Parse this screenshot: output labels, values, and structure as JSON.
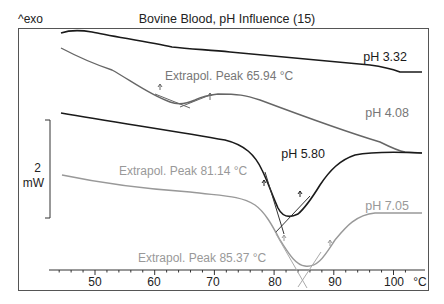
{
  "chart_data": {
    "type": "line",
    "title": "Bovine Blood, pH Influence (15)",
    "ylabel_exo": "^exo",
    "scale_bar": {
      "value": "2",
      "unit": "mW"
    },
    "xlabel": "°C",
    "xlim": [
      44,
      103
    ],
    "xticks": [
      50,
      60,
      70,
      80,
      90,
      100
    ],
    "x_tick_labels": [
      "50",
      "60",
      "70",
      "80",
      "90",
      "100"
    ],
    "grid": false,
    "legend_position": "inline labels at right of curves",
    "series": [
      {
        "name": "pH 3.32",
        "color": "#1a1a1a",
        "x": [
          45,
          47,
          50,
          55,
          60,
          65,
          70,
          75,
          80,
          85,
          90,
          95,
          98,
          100,
          102
        ],
        "y_rel_mW": [
          0.0,
          0.05,
          0.0,
          -0.2,
          -0.4,
          -0.65,
          -0.7,
          -0.8,
          -0.9,
          -1.0,
          -1.05,
          -1.15,
          -1.35,
          -1.35,
          -1.35
        ]
      },
      {
        "name": "pH 4.08",
        "color": "#666666",
        "annotation": "Extrapol. Peak 65.94 °C",
        "peak_temp_C": 65.94,
        "x": [
          45,
          50,
          55,
          60,
          63,
          66,
          69,
          72,
          78,
          85,
          92,
          97,
          100,
          102
        ],
        "y_rel_mW": [
          -0.3,
          -0.9,
          -1.5,
          -2.1,
          -2.4,
          -2.5,
          -2.3,
          -2.2,
          -2.25,
          -2.8,
          -3.4,
          -3.8,
          -4.05,
          -4.1
        ]
      },
      {
        "name": "pH 5.80",
        "color": "#1a1a1a",
        "annotation": "Extrapol. Peak 81.14 °C",
        "peak_temp_C": 81.14,
        "x": [
          45,
          55,
          65,
          70,
          74,
          77,
          79,
          80.5,
          82,
          84,
          86,
          88,
          92,
          96,
          102
        ],
        "y_rel_mW": [
          -4.6,
          -4.9,
          -5.2,
          -5.4,
          -5.9,
          -6.6,
          -7.5,
          -8.0,
          -7.9,
          -7.2,
          -6.2,
          -5.5,
          -4.95,
          -4.85,
          -4.85
        ]
      },
      {
        "name": "pH 7.05",
        "color": "#999999",
        "annotation": "Extrapol. Peak 85.37 °C",
        "peak_temp_C": 85.37,
        "x": [
          45,
          55,
          65,
          72,
          76,
          79,
          82,
          84,
          86,
          88,
          90,
          93,
          96,
          102
        ],
        "y_rel_mW": [
          -6.8,
          -7.3,
          -7.6,
          -7.9,
          -8.4,
          -9.1,
          -10.1,
          -10.4,
          -10.35,
          -9.8,
          -8.8,
          -8.0,
          -7.7,
          -7.7
        ]
      }
    ],
    "annotations": [
      {
        "text": "Extrapol. Peak 65.94 °C",
        "color": "#777777"
      },
      {
        "text": "Extrapol. Peak 81.14 °C",
        "color": "#999999"
      },
      {
        "text": "Extrapol. Peak 85.37 °C",
        "color": "#999999"
      }
    ]
  }
}
